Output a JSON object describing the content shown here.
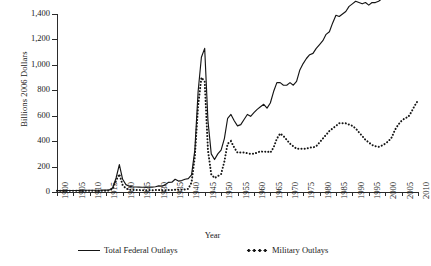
{
  "chart_data": {
    "type": "line",
    "title": "",
    "xlabel": "Year",
    "ylabel": "Billions 2006 Dollars",
    "xlim": [
      1900,
      2010
    ],
    "ylim": [
      0,
      1400
    ],
    "ytick_labels": [
      "1,400",
      "1,200",
      "1,000",
      "800",
      "600",
      "400",
      "200",
      "0"
    ],
    "ytick_values": [
      1400,
      1200,
      1000,
      800,
      600,
      400,
      200,
      0
    ],
    "xtick_labels": [
      "1900",
      "1905",
      "1910",
      "1915",
      "1920",
      "1925",
      "1930",
      "1935",
      "1940",
      "1945",
      "1950",
      "1955",
      "1960",
      "1965",
      "1970",
      "1975",
      "1980",
      "1985",
      "1990",
      "1995",
      "2000",
      "2005",
      "2010"
    ],
    "xtick_values": [
      1900,
      1905,
      1910,
      1915,
      1920,
      1925,
      1930,
      1935,
      1940,
      1945,
      1950,
      1955,
      1960,
      1965,
      1970,
      1975,
      1980,
      1985,
      1990,
      1995,
      2000,
      2005,
      2010
    ],
    "grid": false,
    "legend_position": "bottom",
    "x": [
      1900,
      1901,
      1902,
      1903,
      1904,
      1905,
      1906,
      1907,
      1908,
      1909,
      1910,
      1911,
      1912,
      1913,
      1914,
      1915,
      1916,
      1917,
      1918,
      1919,
      1920,
      1921,
      1922,
      1923,
      1924,
      1925,
      1926,
      1927,
      1928,
      1929,
      1930,
      1931,
      1932,
      1933,
      1934,
      1935,
      1936,
      1937,
      1938,
      1939,
      1940,
      1941,
      1942,
      1943,
      1944,
      1945,
      1946,
      1947,
      1948,
      1949,
      1950,
      1951,
      1952,
      1953,
      1954,
      1955,
      1956,
      1957,
      1958,
      1959,
      1960,
      1961,
      1962,
      1963,
      1964,
      1965,
      1966,
      1967,
      1968,
      1969,
      1970,
      1971,
      1972,
      1973,
      1974,
      1975,
      1976,
      1977,
      1978,
      1979,
      1980,
      1981,
      1982,
      1983,
      1984,
      1985,
      1986,
      1987,
      1988,
      1989,
      1990,
      1991,
      1992,
      1993,
      1994,
      1995,
      1996,
      1997,
      1998,
      1999,
      2000,
      2001,
      2002,
      2003,
      2004,
      2005,
      2006,
      2007,
      2008,
      2009,
      2010
    ],
    "series": [
      {
        "name": "Total Federal Outlays",
        "style": "solid",
        "values": [
          11,
          11,
          11,
          12,
          12,
          12,
          12,
          13,
          14,
          14,
          14,
          14,
          14,
          14,
          15,
          15,
          17,
          34,
          110,
          215,
          100,
          58,
          45,
          40,
          39,
          38,
          37,
          38,
          38,
          38,
          41,
          48,
          46,
          58,
          76,
          77,
          100,
          86,
          90,
          100,
          105,
          135,
          330,
          790,
          1060,
          1130,
          560,
          300,
          255,
          300,
          330,
          420,
          580,
          610,
          560,
          520,
          530,
          570,
          610,
          595,
          625,
          650,
          670,
          690,
          660,
          700,
          790,
          860,
          860,
          840,
          840,
          860,
          840,
          870,
          960,
          1010,
          1050,
          1080,
          1090,
          1130,
          1160,
          1190,
          1240,
          1260,
          1330,
          1390,
          1380,
          1400,
          1420,
          1460,
          1480,
          1500,
          1490,
          1480,
          1490,
          1470,
          1490,
          1490,
          1500,
          1520,
          1570,
          1640,
          1730,
          1800,
          1850,
          1900,
          1930,
          1990,
          2130,
          2260,
          2310
        ]
      },
      {
        "name": "Military Outlays",
        "style": "dotted",
        "values": [
          9,
          9,
          9,
          9,
          9,
          9,
          9,
          10,
          10,
          10,
          10,
          10,
          10,
          10,
          10,
          10,
          12,
          26,
          90,
          140,
          55,
          28,
          18,
          16,
          15,
          15,
          14,
          14,
          14,
          14,
          15,
          15,
          14,
          14,
          16,
          16,
          18,
          17,
          18,
          20,
          25,
          75,
          280,
          680,
          900,
          870,
          330,
          140,
          110,
          125,
          140,
          240,
          380,
          400,
          350,
          310,
          310,
          310,
          305,
          300,
          300,
          310,
          320,
          315,
          320,
          310,
          350,
          420,
          460,
          440,
          410,
          380,
          360,
          340,
          340,
          340,
          340,
          350,
          350,
          360,
          390,
          420,
          450,
          480,
          500,
          520,
          540,
          540,
          540,
          530,
          520,
          500,
          470,
          440,
          410,
          390,
          370,
          360,
          355,
          365,
          380,
          400,
          430,
          490,
          530,
          560,
          580,
          590,
          630,
          680,
          720
        ]
      }
    ]
  },
  "legend": {
    "total_label": "Total Federal Outlays",
    "military_label": "Military Outlays"
  },
  "icons": {
    "solid_line": "solid-line-swatch",
    "dotted_line": "dotted-line-swatch"
  }
}
